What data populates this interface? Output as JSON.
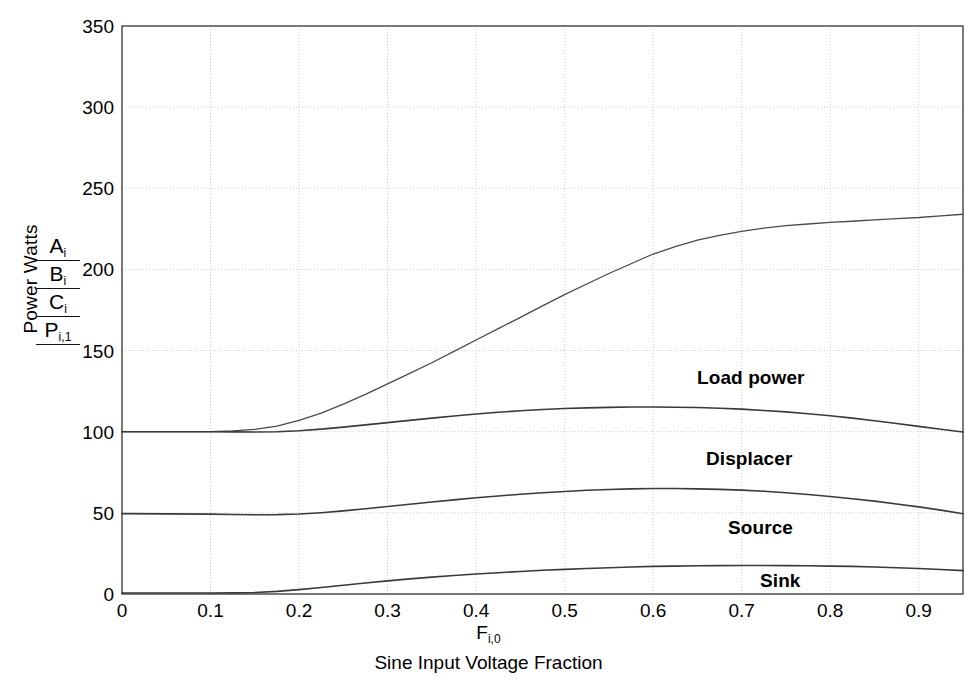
{
  "chart_data": {
    "type": "line",
    "title": "",
    "xlabel": "F i,0",
    "xlabel_symbol": "F",
    "xlabel_symbol_sub": "i,0",
    "xlabel_description": "Sine Input Voltage Fraction",
    "ylabel": "Power Watts",
    "xlim": [
      0,
      0.95
    ],
    "ylim": [
      0,
      350
    ],
    "xticks": [
      "0",
      "0.1",
      "0.2",
      "0.3",
      "0.4",
      "0.5",
      "0.6",
      "0.7",
      "0.8",
      "0.9"
    ],
    "xtick_values": [
      0,
      0.1,
      0.2,
      0.3,
      0.4,
      0.5,
      0.6,
      0.7,
      0.8,
      0.9
    ],
    "yticks": [
      "0",
      "50",
      "100",
      "150",
      "200",
      "250",
      "300",
      "350"
    ],
    "ytick_values": [
      0,
      50,
      100,
      150,
      200,
      250,
      300,
      350
    ],
    "grid": true,
    "grid_style": "dotted",
    "grid_color": "#cfcfcf",
    "axis_color": "#222222",
    "legend_position": "y-axis-stack",
    "legend_entries": [
      {
        "key": "A",
        "sub": "i",
        "name": "A_i",
        "maps_to": "Load power"
      },
      {
        "key": "B",
        "sub": "i",
        "name": "B_i",
        "maps_to": "Displacer"
      },
      {
        "key": "C",
        "sub": "i",
        "name": "C_i",
        "maps_to": "Source"
      },
      {
        "key": "P",
        "sub": "i,1",
        "name": "P_i,1",
        "maps_to": "Sink"
      }
    ],
    "annotations": [
      {
        "text": "Load power",
        "x": 0.67,
        "y": 140,
        "px": 697,
        "py": 367
      },
      {
        "text": "Displacer",
        "x": 0.68,
        "y": 75,
        "px": 706,
        "py": 448
      },
      {
        "text": "Source",
        "x": 0.71,
        "y": 33,
        "px": 728,
        "py": 517
      },
      {
        "text": "Sink",
        "x": 0.75,
        "y": 8,
        "px": 760,
        "py": 570
      }
    ],
    "x": [
      0,
      0.05,
      0.1,
      0.125,
      0.15,
      0.175,
      0.2,
      0.225,
      0.25,
      0.275,
      0.3,
      0.325,
      0.35,
      0.375,
      0.4,
      0.425,
      0.45,
      0.475,
      0.5,
      0.525,
      0.55,
      0.575,
      0.6,
      0.625,
      0.65,
      0.675,
      0.7,
      0.725,
      0.75,
      0.775,
      0.8,
      0.825,
      0.85,
      0.875,
      0.9,
      0.925,
      0.95
    ],
    "series": [
      {
        "name": "A_i",
        "label": "Load power",
        "color": "#4a4a4a",
        "width": 1.3,
        "values": [
          100,
          100,
          100,
          100.5,
          101.5,
          103.5,
          107,
          111.5,
          117,
          123,
          129.5,
          136,
          142.5,
          149.5,
          156.5,
          163.5,
          170.5,
          177.5,
          184.5,
          191,
          197.5,
          203.5,
          209.5,
          214,
          218,
          221,
          223.5,
          225.5,
          227,
          228,
          229,
          229.7,
          230.5,
          231.3,
          232,
          233,
          234
        ]
      },
      {
        "name": "B_i",
        "label": "Displacer",
        "color": "#3a3a3a",
        "width": 1.6,
        "values": [
          100,
          100,
          100,
          99.9,
          99.8,
          100,
          100.6,
          101.6,
          102.8,
          104.2,
          105.6,
          107,
          108.4,
          109.7,
          110.9,
          112,
          112.9,
          113.7,
          114.3,
          114.7,
          115,
          115.2,
          115.2,
          115.1,
          114.9,
          114.5,
          113.9,
          113.1,
          112.2,
          111.1,
          109.8,
          108.4,
          106.8,
          105.1,
          103.3,
          101.5,
          99.8
        ]
      },
      {
        "name": "C_i",
        "label": "Source",
        "color": "#3a3a3a",
        "width": 1.6,
        "values": [
          49.5,
          49.4,
          49.2,
          49,
          48.8,
          48.9,
          49.3,
          50.1,
          51.2,
          52.5,
          53.9,
          55.3,
          56.7,
          58,
          59.3,
          60.4,
          61.5,
          62.4,
          63.2,
          63.9,
          64.4,
          64.8,
          65,
          65,
          64.8,
          64.5,
          64,
          63.3,
          62.4,
          61.3,
          60.1,
          58.7,
          57.2,
          55.5,
          53.7,
          51.7,
          49.5
        ]
      },
      {
        "name": "P_i,1",
        "label": "Sink",
        "color": "#3a3a3a",
        "width": 1.6,
        "values": [
          0.6,
          0.6,
          0.6,
          0.7,
          0.9,
          1.6,
          2.7,
          4,
          5.4,
          6.8,
          8.1,
          9.3,
          10.4,
          11.4,
          12.3,
          13.1,
          13.9,
          14.6,
          15.2,
          15.7,
          16.2,
          16.6,
          17,
          17.2,
          17.4,
          17.5,
          17.6,
          17.6,
          17.5,
          17.4,
          17.2,
          17,
          16.6,
          16.2,
          15.7,
          15.1,
          14.4
        ]
      }
    ]
  },
  "axis": {
    "ylabel_text": "Power Watts"
  }
}
